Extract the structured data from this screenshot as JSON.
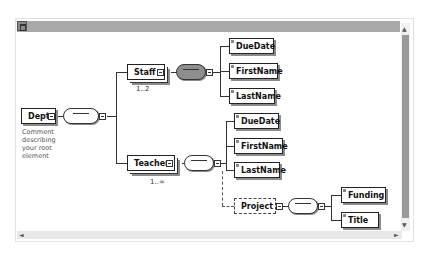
{
  "toolbar": {
    "icon": "expand-icon"
  },
  "root": {
    "label": "Dept",
    "comment": "Comment describing your root element"
  },
  "staff": {
    "label": "Staff",
    "cardinality": "1..2",
    "children": [
      "DueDate",
      "FirstName",
      "LastName"
    ]
  },
  "teacher": {
    "label": "Teacher",
    "cardinality": "1..∞",
    "children": [
      "DueDate",
      "FirstName",
      "LastName"
    ],
    "optional_child": "Project"
  },
  "project": {
    "label": "Project",
    "children": [
      "Funding",
      "Title"
    ]
  },
  "compositor_symbol": "•••",
  "scrollbars": {
    "up": "▲",
    "down": "▼",
    "left": "◄",
    "right": "►"
  },
  "colors": {
    "toolbar": "#a9a9a9",
    "dark_sequence": "#8e8e8e",
    "shadow": "#8c8c8c"
  }
}
